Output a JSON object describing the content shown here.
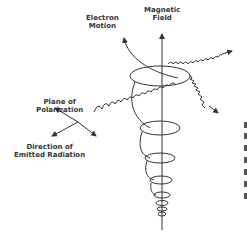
{
  "diagram": {
    "labels": {
      "magnetic_field": [
        "Magnetic",
        "Field"
      ],
      "electron_motion": [
        "Electron",
        "Motion"
      ],
      "plane_of_polarization": [
        "Plane of",
        "Polarization"
      ],
      "direction_of_radiation": [
        "Direction of",
        "Emitted Radiation"
      ]
    },
    "colors": {
      "line": "#333333",
      "background": "#ffffff"
    }
  }
}
